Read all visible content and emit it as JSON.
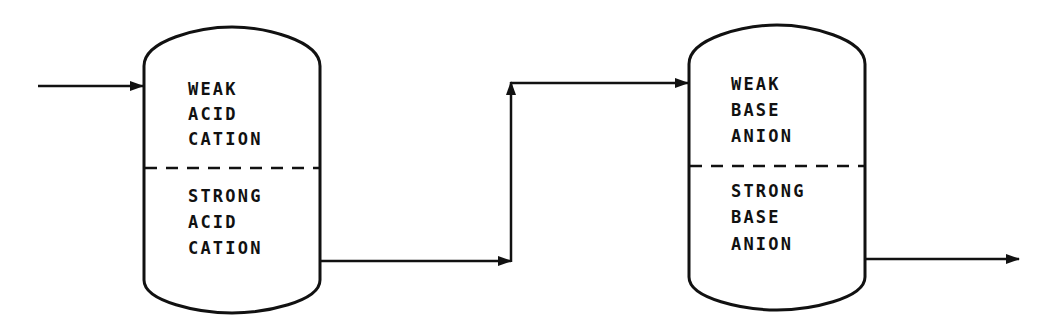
{
  "diagram": {
    "type": "process-flow",
    "colors": {
      "line": "#111111",
      "background": "#ffffff"
    },
    "vessels": [
      {
        "id": "cation-vessel",
        "upper_bed": {
          "lines": [
            "WEAK",
            "ACID",
            "CATION"
          ]
        },
        "lower_bed": {
          "lines": [
            "STRONG",
            "ACID",
            "CATION"
          ]
        }
      },
      {
        "id": "anion-vessel",
        "upper_bed": {
          "lines": [
            "WEAK",
            "BASE",
            "ANION"
          ]
        },
        "lower_bed": {
          "lines": [
            "STRONG",
            "BASE",
            "ANION"
          ]
        }
      }
    ],
    "flows": [
      {
        "id": "inlet",
        "from": "external",
        "to": "cation-vessel-top"
      },
      {
        "id": "cation-outlet",
        "from": "cation-vessel-bottom",
        "to": "riser"
      },
      {
        "id": "riser",
        "from": "riser-bottom",
        "to": "riser-top"
      },
      {
        "id": "anion-inlet",
        "from": "riser-top",
        "to": "anion-vessel-top"
      },
      {
        "id": "outlet",
        "from": "anion-vessel-bottom",
        "to": "external"
      }
    ]
  }
}
